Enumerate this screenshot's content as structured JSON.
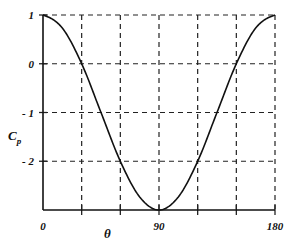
{
  "chart_data": {
    "type": "line",
    "title": "",
    "xlabel": "θ",
    "ylabel": "C_p",
    "ylabel_main": "C",
    "ylabel_sub": "p",
    "xlim": [
      0,
      180
    ],
    "ylim": [
      -3,
      1
    ],
    "grid": true,
    "grid_style": "dashed",
    "x_ticks": [
      0,
      30,
      60,
      90,
      120,
      150,
      180
    ],
    "x_tick_labels": [
      "0",
      "",
      "",
      "90",
      "",
      "",
      "180"
    ],
    "y_ticks": [
      1,
      0,
      -1,
      -2
    ],
    "y_tick_labels": [
      "1",
      "0",
      "- 1",
      "- 2"
    ],
    "series": [
      {
        "name": "Cp = 1 - 4 sin²θ",
        "x": [
          0,
          15,
          30,
          45,
          60,
          75,
          90,
          105,
          120,
          135,
          150,
          165,
          180
        ],
        "values": [
          1.0,
          0.732,
          0.0,
          -1.0,
          -2.0,
          -2.732,
          -3.0,
          -2.732,
          -2.0,
          -1.0,
          0.0,
          0.732,
          1.0
        ]
      }
    ],
    "colors": {
      "line": "#111111",
      "grid": "#222222",
      "axis": "#111111"
    }
  }
}
